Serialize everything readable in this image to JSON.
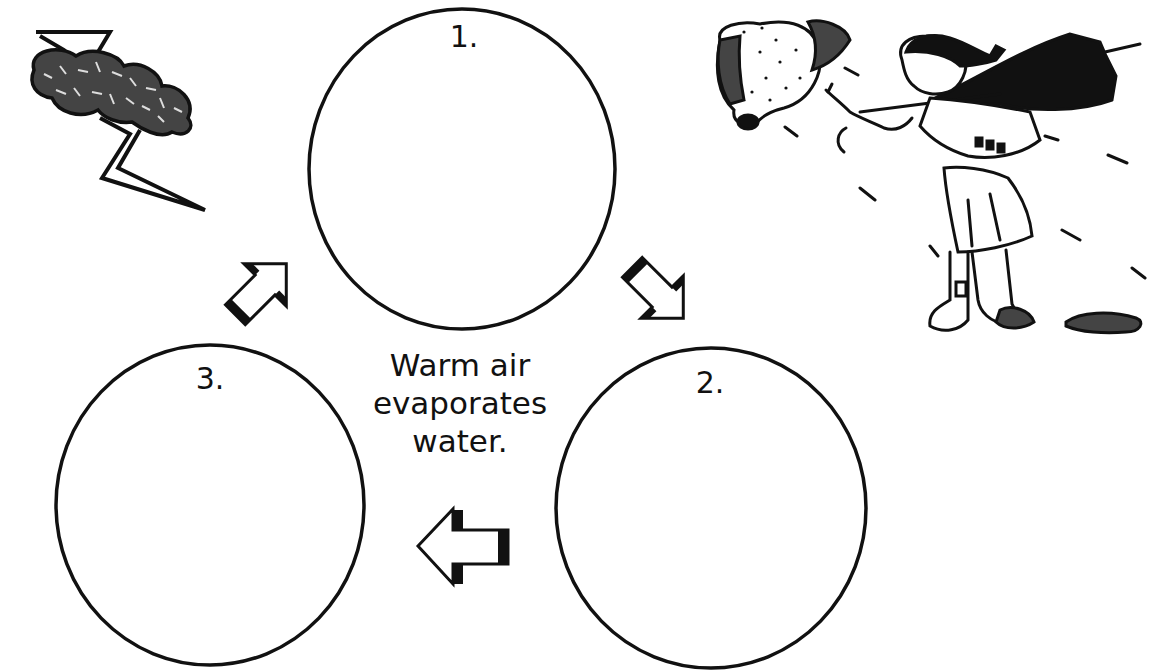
{
  "diagram": {
    "center_text": [
      "Warm air",
      "evaporates",
      "water."
    ],
    "steps": [
      {
        "label": "1.",
        "content": ""
      },
      {
        "label": "2.",
        "content": ""
      },
      {
        "label": "3.",
        "content": ""
      }
    ],
    "arrows": [
      {
        "from": "3",
        "to": "1",
        "direction": "up-right"
      },
      {
        "from": "1",
        "to": "2",
        "direction": "down-right"
      },
      {
        "from": "2",
        "to": "3",
        "direction": "left"
      }
    ],
    "illustrations": [
      {
        "name": "storm-cloud-with-lightning",
        "position": "top-left"
      },
      {
        "name": "girl-with-umbrella-in-wind-and-rain",
        "position": "top-right"
      }
    ],
    "colors": {
      "ink": "#111111",
      "background": "#ffffff"
    }
  }
}
